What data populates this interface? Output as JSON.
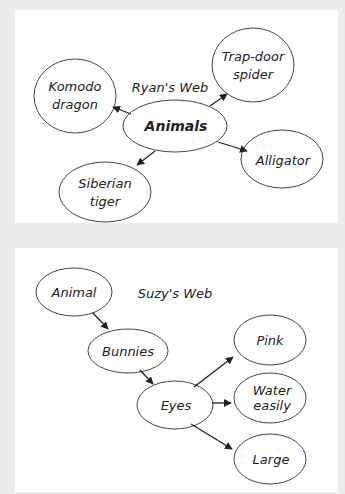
{
  "webs": [
    {
      "title": "Ryan's Web",
      "center": "Animals",
      "nodes": [
        {
          "line1": "Komodo",
          "line2": "dragon"
        },
        {
          "line1": "Trap-door",
          "line2": "spider"
        },
        {
          "line1": "Alligator",
          "line2": ""
        },
        {
          "line1": "Siberian",
          "line2": "tiger"
        }
      ]
    },
    {
      "title": "Suzy's Web",
      "nodes": [
        {
          "line1": "Animal",
          "line2": ""
        },
        {
          "line1": "Bunnies",
          "line2": ""
        },
        {
          "line1": "Eyes",
          "line2": ""
        },
        {
          "line1": "Pink",
          "line2": ""
        },
        {
          "line1": "Water",
          "line2": "easily"
        },
        {
          "line1": "Large",
          "line2": ""
        }
      ]
    }
  ],
  "colors": {
    "background": "#ececec",
    "panel": "#ffffff",
    "stroke": "#333333"
  }
}
